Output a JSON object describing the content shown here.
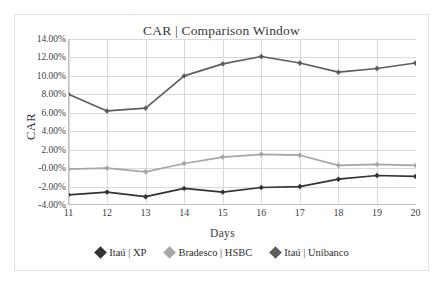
{
  "chart_data": {
    "type": "line",
    "title": "CAR | Comparison Window",
    "xlabel": "Days",
    "ylabel": "CAR",
    "categories": [
      11,
      12,
      13,
      14,
      15,
      16,
      17,
      18,
      19,
      20
    ],
    "x": [
      11,
      12,
      13,
      14,
      15,
      16,
      17,
      18,
      19,
      20
    ],
    "xtick_labels": [
      "11",
      "12",
      "13",
      "14",
      "15",
      "16",
      "17",
      "18",
      "19",
      "20"
    ],
    "ytick_labels": [
      "14.00%",
      "12.00%",
      "10.00%",
      "8.00%",
      "6.00%",
      "4.00%",
      "2.00%",
      "-0.00%",
      "-2.00%",
      "-4.00%"
    ],
    "ytick_values": [
      14,
      12,
      10,
      8,
      6,
      4,
      2,
      0,
      -2,
      -4
    ],
    "ylim": [
      -4,
      14
    ],
    "xlim": [
      11,
      20
    ],
    "grid": true,
    "grid_axis": "both",
    "legend_position": "bottom",
    "value_format": "percent",
    "series": [
      {
        "name": "Itaú | XP",
        "color": "#333333",
        "marker": "diamond",
        "values": [
          -2.9,
          -2.6,
          -3.1,
          -2.2,
          -2.6,
          -2.1,
          -2.0,
          -1.2,
          -0.8,
          -0.9
        ]
      },
      {
        "name": "Bradesco | HSBC",
        "color": "#a6a6a6",
        "marker": "diamond",
        "values": [
          -0.1,
          0.0,
          -0.4,
          0.5,
          1.2,
          1.5,
          1.4,
          0.3,
          0.4,
          0.3
        ]
      },
      {
        "name": "Itaú | Unibanco",
        "color": "#5e5e5e",
        "marker": "diamond",
        "values": [
          8.0,
          6.2,
          6.5,
          10.0,
          11.3,
          12.1,
          11.4,
          10.4,
          10.8,
          11.4
        ]
      }
    ]
  },
  "colors": {
    "background": "#ffffff",
    "border": "#e2e2e2",
    "grid": "#d9d9d9",
    "axis": "#bfbfbf",
    "text": "#3a3a3a",
    "series_itau_xp": "#333333",
    "series_bradesco_hsbc": "#a6a6a6",
    "series_itau_unibanco": "#5e5e5e"
  }
}
